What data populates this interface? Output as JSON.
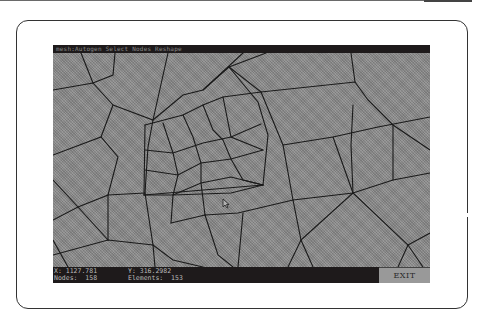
{
  "window": {
    "title": "mesh:Autogen Select Nodes Reshape"
  },
  "status": {
    "x_label": "X:",
    "x_value": "1127.781",
    "y_label": "Y:",
    "y_value": "316.2982",
    "nodes_label": "Nodes:",
    "nodes_value": "158",
    "elements_label": "Elements:",
    "elements_value": "153"
  },
  "buttons": {
    "exit_label": "EXIT"
  },
  "colors": {
    "screen_bg": "#8d8d8d",
    "bar_bg": "#1e1a1b",
    "mesh_line": "#1a1a1a",
    "frame_border": "#333333"
  },
  "mesh": {
    "node_count": 158,
    "element_count": 153
  }
}
